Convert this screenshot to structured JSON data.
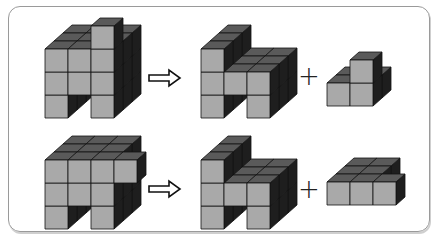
{
  "diagram": {
    "colors": {
      "front": "#a9a9a9",
      "top": "#5a5a5a",
      "side": "#1e1e1e",
      "edge": "#111111",
      "frame": "#9a9a9a"
    },
    "rows": [
      {
        "operator_arrow": "arrow-right-outline",
        "operator_plus": "+",
        "whole": {
          "label": "whole-structure-1",
          "cubes": [
            [
              0,
              0,
              0
            ],
            [
              2,
              0,
              0
            ],
            [
              0,
              1,
              0
            ],
            [
              1,
              1,
              0
            ],
            [
              2,
              1,
              0
            ],
            [
              0,
              2,
              0
            ],
            [
              1,
              2,
              0
            ],
            [
              2,
              2,
              0
            ],
            [
              2,
              3,
              0
            ],
            [
              0,
              0,
              1
            ],
            [
              2,
              0,
              1
            ],
            [
              0,
              1,
              1
            ],
            [
              1,
              1,
              1
            ],
            [
              2,
              1,
              1
            ],
            [
              0,
              2,
              1
            ],
            [
              1,
              2,
              1
            ],
            [
              2,
              2,
              1
            ],
            [
              0,
              0,
              2
            ],
            [
              2,
              0,
              2
            ],
            [
              0,
              1,
              2
            ],
            [
              1,
              1,
              2
            ],
            [
              2,
              1,
              2
            ],
            [
              0,
              2,
              2
            ],
            [
              1,
              2,
              2
            ],
            [
              2,
              2,
              2
            ]
          ]
        },
        "part_a": {
          "label": "part-a-1",
          "cubes": [
            [
              0,
              0,
              0
            ],
            [
              2,
              0,
              0
            ],
            [
              0,
              1,
              0
            ],
            [
              1,
              1,
              0
            ],
            [
              2,
              1,
              0
            ],
            [
              0,
              2,
              0
            ],
            [
              0,
              0,
              1
            ],
            [
              2,
              0,
              1
            ],
            [
              0,
              1,
              1
            ],
            [
              1,
              1,
              1
            ],
            [
              2,
              1,
              1
            ],
            [
              0,
              2,
              1
            ],
            [
              0,
              0,
              2
            ],
            [
              2,
              0,
              2
            ],
            [
              0,
              1,
              2
            ],
            [
              1,
              1,
              2
            ],
            [
              2,
              1,
              2
            ],
            [
              0,
              2,
              2
            ]
          ]
        },
        "part_b": {
          "label": "part-b-1",
          "cubes": [
            [
              0,
              0,
              0
            ],
            [
              1,
              0,
              0
            ],
            [
              1,
              1,
              0
            ],
            [
              0,
              0,
              1
            ],
            [
              1,
              0,
              1
            ]
          ]
        }
      },
      {
        "operator_arrow": "arrow-right-outline",
        "operator_plus": "+",
        "whole": {
          "label": "whole-structure-2",
          "cubes": [
            [
              0,
              0,
              0
            ],
            [
              2,
              0,
              0
            ],
            [
              0,
              1,
              0
            ],
            [
              1,
              1,
              0
            ],
            [
              2,
              1,
              0
            ],
            [
              0,
              2,
              0
            ],
            [
              1,
              2,
              0
            ],
            [
              2,
              2,
              0
            ],
            [
              3,
              2,
              0
            ],
            [
              0,
              0,
              1
            ],
            [
              2,
              0,
              1
            ],
            [
              0,
              1,
              1
            ],
            [
              1,
              1,
              1
            ],
            [
              2,
              1,
              1
            ],
            [
              0,
              2,
              1
            ],
            [
              1,
              2,
              1
            ],
            [
              2,
              2,
              1
            ],
            [
              0,
              0,
              2
            ],
            [
              2,
              0,
              2
            ],
            [
              0,
              1,
              2
            ],
            [
              1,
              1,
              2
            ],
            [
              2,
              1,
              2
            ],
            [
              0,
              2,
              2
            ],
            [
              1,
              2,
              2
            ],
            [
              2,
              2,
              2
            ]
          ]
        },
        "part_a": {
          "label": "part-a-2",
          "cubes": [
            [
              0,
              0,
              0
            ],
            [
              2,
              0,
              0
            ],
            [
              0,
              1,
              0
            ],
            [
              1,
              1,
              0
            ],
            [
              2,
              1,
              0
            ],
            [
              0,
              2,
              0
            ],
            [
              0,
              0,
              1
            ],
            [
              2,
              0,
              1
            ],
            [
              0,
              1,
              1
            ],
            [
              1,
              1,
              1
            ],
            [
              2,
              1,
              1
            ],
            [
              0,
              2,
              1
            ],
            [
              0,
              0,
              2
            ],
            [
              2,
              0,
              2
            ],
            [
              0,
              1,
              2
            ],
            [
              1,
              1,
              2
            ],
            [
              2,
              1,
              2
            ],
            [
              0,
              2,
              2
            ]
          ]
        },
        "part_b": {
          "label": "part-b-2",
          "cubes": [
            [
              0,
              0,
              0
            ],
            [
              1,
              0,
              0
            ],
            [
              2,
              0,
              0
            ],
            [
              0,
              0,
              1
            ],
            [
              1,
              0,
              1
            ],
            [
              0,
              0,
              2
            ],
            [
              1,
              0,
              2
            ]
          ]
        }
      }
    ]
  }
}
